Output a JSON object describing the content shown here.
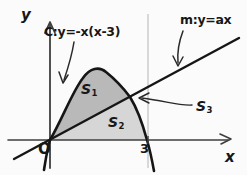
{
  "figure": {
    "kind": "hand-drawn-math-diagram",
    "background_color": "#fbfbfb",
    "ink_color": "#171717"
  },
  "axes": {
    "y_label": "y",
    "x_label": "x",
    "origin_label": "O",
    "x_ticks": [
      {
        "value": "3",
        "label": "3"
      }
    ]
  },
  "curves": {
    "parabola": {
      "label": "C:y=-x(x-3)",
      "name": "C",
      "equation": "y=-x(x-3)",
      "roots": [
        "0",
        "3"
      ]
    },
    "line": {
      "label": "m:y=ax",
      "name": "m",
      "equation": "y=ax"
    }
  },
  "regions": [
    {
      "id": "S1",
      "label": "S",
      "subscript": "1",
      "fill_color": "#b9b9b9",
      "description": "area between parabola and line above the line"
    },
    {
      "id": "S2",
      "label": "S",
      "subscript": "2",
      "fill_color": "#d6d6d6",
      "description": "area between line and x-axis under the parabola"
    },
    {
      "id": "S3",
      "label": "S",
      "subscript": "3",
      "fill_color": "#fbfbfb",
      "description": "area right of the intersection between line and parabola"
    }
  ],
  "gridlines": {
    "vertical_at_x3_color": "#c9c9c9"
  }
}
